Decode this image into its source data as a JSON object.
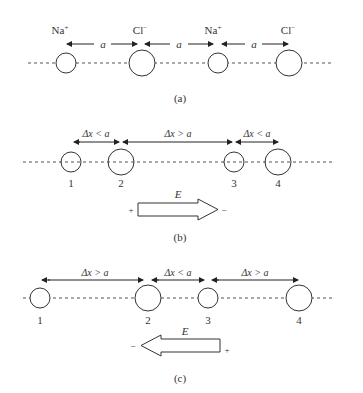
{
  "panels": {
    "a": {
      "caption": "(a)",
      "ions": [
        {
          "label": "Na",
          "sup": "+",
          "x": 66,
          "r": 10
        },
        {
          "label": "Cl",
          "sup": "−",
          "x": 142,
          "r": 13
        },
        {
          "label": "Na",
          "sup": "+",
          "x": 218,
          "r": 10
        },
        {
          "label": "Cl",
          "sup": "−",
          "x": 289,
          "r": 13
        }
      ],
      "spacings": [
        {
          "label": "a",
          "from": 66,
          "to": 138
        },
        {
          "label": "a",
          "from": 146,
          "to": 214
        },
        {
          "label": "a",
          "from": 222,
          "to": 289
        }
      ]
    },
    "b": {
      "caption": "(b)",
      "ions": [
        {
          "num": "1",
          "x": 71,
          "r": 10
        },
        {
          "num": "2",
          "x": 121,
          "r": 13
        },
        {
          "num": "3",
          "x": 234,
          "r": 10
        },
        {
          "num": "4",
          "x": 278,
          "r": 13
        }
      ],
      "spacings": [
        {
          "label": "Δx < a",
          "from": 73,
          "to": 120
        },
        {
          "label": "Δx > a",
          "from": 122,
          "to": 233
        },
        {
          "label": "Δx < a",
          "from": 235,
          "to": 278
        }
      ],
      "field": {
        "label": "E",
        "direction": "right",
        "plus": "+",
        "minus": "−"
      }
    },
    "c": {
      "caption": "(c)",
      "ions": [
        {
          "num": "1",
          "x": 40,
          "r": 10
        },
        {
          "num": "2",
          "x": 148,
          "r": 13
        },
        {
          "num": "3",
          "x": 208,
          "r": 10
        },
        {
          "num": "4",
          "x": 299,
          "r": 13
        }
      ],
      "spacings": [
        {
          "label": "Δx > a",
          "from": 41,
          "to": 143
        },
        {
          "label": "Δx < a",
          "from": 152,
          "to": 204
        },
        {
          "label": "Δx > a",
          "from": 212,
          "to": 298
        }
      ],
      "field": {
        "label": "E",
        "direction": "left",
        "plus": "+",
        "minus": "−"
      }
    }
  },
  "colors": {
    "stroke": "#333333",
    "dash": "#555555",
    "background": "#ffffff"
  }
}
